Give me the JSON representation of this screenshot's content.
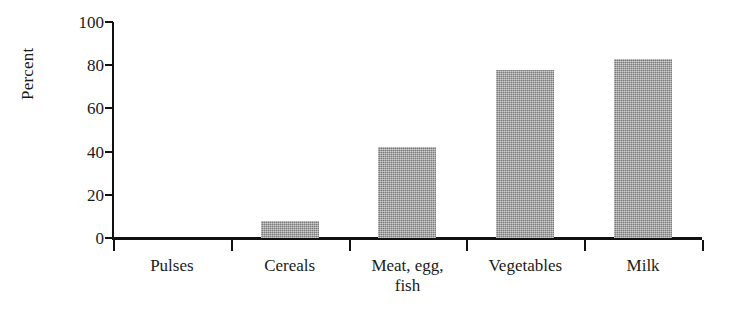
{
  "chart_data": {
    "type": "bar",
    "title": "",
    "subtitle": "",
    "xlabel": "",
    "ylabel": "Percent",
    "categories": [
      "Pulses",
      "Cereals",
      "Meat, egg, fish",
      "Vegetables",
      "Milk"
    ],
    "category_lines": [
      [
        "Pulses"
      ],
      [
        "Cereals"
      ],
      [
        "Meat, egg,",
        "fish"
      ],
      [
        "Vegetables"
      ],
      [
        "Milk"
      ]
    ],
    "values": [
      0,
      8,
      42,
      78,
      83
    ],
    "ylim": [
      0,
      100
    ],
    "yticks": [
      0,
      20,
      40,
      60,
      80,
      100
    ],
    "ytick_labels": [
      "0",
      "20",
      "40",
      "60",
      "80",
      "100"
    ],
    "grid": false,
    "legend": null,
    "bar_color": "#9d9d9d",
    "axis_color": "#111111"
  }
}
